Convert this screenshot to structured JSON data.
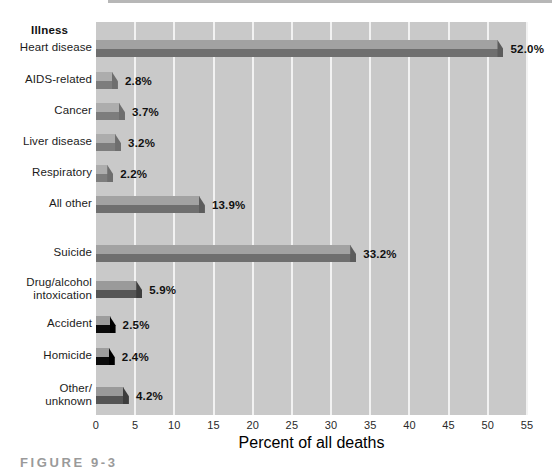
{
  "figure": {
    "caption": "FIGURE 9-3"
  },
  "chart_data": {
    "type": "bar",
    "orientation": "horizontal",
    "title": "",
    "xlabel": "Percent of all deaths",
    "ylabel": "",
    "xlim": [
      0,
      55
    ],
    "xticks": [
      0,
      5,
      10,
      15,
      20,
      25,
      30,
      35,
      40,
      45,
      50,
      55
    ],
    "xtick_labels": [
      "0",
      "5",
      "10",
      "15",
      "20",
      "25",
      "30",
      "35",
      "40",
      "45",
      "50",
      "55"
    ],
    "grid": "vertical-white-gridlines",
    "legend": "none",
    "group_headers": [
      "Illness"
    ],
    "categories": [
      "Heart disease",
      "AIDS-related",
      "Cancer",
      "Liver disease",
      "Respiratory",
      "All other",
      "Suicide",
      "Drug/alcohol intoxication",
      "Accident",
      "Homicide",
      "Other/unknown"
    ],
    "values": [
      52.0,
      2.8,
      3.7,
      3.2,
      2.2,
      13.9,
      33.2,
      5.9,
      2.5,
      2.4,
      4.2
    ],
    "value_labels": [
      "52.0%",
      "2.8%",
      "3.7%",
      "3.2%",
      "2.2%",
      "13.9%",
      "33.2%",
      "5.9%",
      "2.5%",
      "2.4%",
      "4.2%"
    ]
  },
  "bars": [
    {
      "label_line1": "Heart disease",
      "label_line2": "",
      "value": 52.0,
      "value_label": "52.0%",
      "style": "big",
      "y": 40,
      "label_y": 41
    },
    {
      "label_line1": "AIDS-related",
      "label_line2": "",
      "value": 2.8,
      "value_label": "2.8%",
      "style": "",
      "y": 72,
      "label_y": 73
    },
    {
      "label_line1": "Cancer",
      "label_line2": "",
      "value": 3.7,
      "value_label": "3.7%",
      "style": "",
      "y": 103,
      "label_y": 104
    },
    {
      "label_line1": "Liver disease",
      "label_line2": "",
      "value": 3.2,
      "value_label": "3.2%",
      "style": "",
      "y": 134,
      "label_y": 135
    },
    {
      "label_line1": "Respiratory",
      "label_line2": "",
      "value": 2.2,
      "value_label": "2.2%",
      "style": "",
      "y": 165,
      "label_y": 166
    },
    {
      "label_line1": "All other",
      "label_line2": "",
      "value": 13.9,
      "value_label": "13.9%",
      "style": "big",
      "y": 196,
      "label_y": 197
    },
    {
      "label_line1": "Suicide",
      "label_line2": "",
      "value": 33.2,
      "value_label": "33.2%",
      "style": "big",
      "y": 245,
      "label_y": 246
    },
    {
      "label_line1": "Drug/alcohol",
      "label_line2": "intoxication",
      "value": 5.9,
      "value_label": "5.9%",
      "style": "dark",
      "y": 281,
      "label_y": 276
    },
    {
      "label_line1": "Accident",
      "label_line2": "",
      "value": 2.5,
      "value_label": "2.5%",
      "style": "black",
      "y": 316,
      "label_y": 317
    },
    {
      "label_line1": "Homicide",
      "label_line2": "",
      "value": 2.4,
      "value_label": "2.4%",
      "style": "black",
      "y": 348,
      "label_y": 349
    },
    {
      "label_line1": "Other/",
      "label_line2": "unknown",
      "value": 4.2,
      "value_label": "4.2%",
      "style": "dark",
      "y": 387,
      "label_y": 382
    }
  ],
  "axis": {
    "title": "Percent of all deaths",
    "ticks": [
      "0",
      "5",
      "10",
      "15",
      "20",
      "25",
      "30",
      "35",
      "40",
      "45",
      "50",
      "55"
    ]
  },
  "group_header": {
    "illness": "Illness"
  }
}
